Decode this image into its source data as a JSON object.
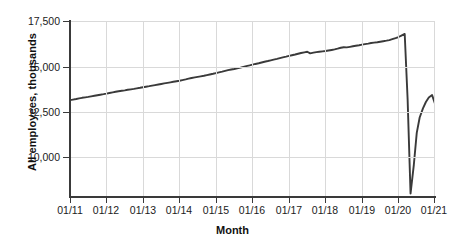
{
  "chart_data": {
    "type": "line",
    "title": "",
    "xlabel": "Month",
    "ylabel": "All employees, thousands",
    "grid": true,
    "legend": "none",
    "xlim": [
      2011.0,
      2021.0
    ],
    "ylim": [
      7830,
      17500
    ],
    "ytick_labels": [
      "17,500",
      "15,000",
      "12,500",
      "10,000"
    ],
    "ytick_values": [
      17500,
      15000,
      12500,
      10000
    ],
    "xtick_labels": [
      "01/11",
      "01/12",
      "01/13",
      "01/14",
      "01/15",
      "01/16",
      "01/17",
      "01/18",
      "01/19",
      "01/20",
      "01/21"
    ],
    "xtick_values": [
      2011,
      2012,
      2013,
      2014,
      2015,
      2016,
      2017,
      2018,
      2019,
      2020,
      2021
    ],
    "series": [
      {
        "name": "All employees",
        "color": "#3a3a3a",
        "x": [
          2011.0,
          2011.08,
          2011.17,
          2011.25,
          2011.33,
          2011.42,
          2011.5,
          2011.58,
          2011.67,
          2011.75,
          2011.83,
          2011.92,
          2012.0,
          2012.08,
          2012.17,
          2012.25,
          2012.33,
          2012.42,
          2012.5,
          2012.58,
          2012.67,
          2012.75,
          2012.83,
          2012.92,
          2013.0,
          2013.08,
          2013.17,
          2013.25,
          2013.33,
          2013.42,
          2013.5,
          2013.58,
          2013.67,
          2013.75,
          2013.83,
          2013.92,
          2014.0,
          2014.08,
          2014.17,
          2014.25,
          2014.33,
          2014.42,
          2014.5,
          2014.58,
          2014.67,
          2014.75,
          2014.83,
          2014.92,
          2015.0,
          2015.08,
          2015.17,
          2015.25,
          2015.33,
          2015.42,
          2015.5,
          2015.58,
          2015.67,
          2015.75,
          2015.83,
          2015.92,
          2016.0,
          2016.08,
          2016.17,
          2016.25,
          2016.33,
          2016.42,
          2016.5,
          2016.58,
          2016.67,
          2016.75,
          2016.83,
          2016.92,
          2017.0,
          2017.08,
          2017.17,
          2017.25,
          2017.33,
          2017.42,
          2017.5,
          2017.58,
          2017.67,
          2017.75,
          2017.83,
          2017.92,
          2018.0,
          2018.08,
          2018.17,
          2018.25,
          2018.33,
          2018.42,
          2018.5,
          2018.58,
          2018.67,
          2018.75,
          2018.83,
          2018.92,
          2019.0,
          2019.08,
          2019.17,
          2019.25,
          2019.33,
          2019.42,
          2019.5,
          2019.58,
          2019.67,
          2019.75,
          2019.83,
          2019.92,
          2020.0,
          2020.08,
          2020.17,
          2020.25,
          2020.33,
          2020.42,
          2020.5,
          2020.58,
          2020.67,
          2020.75,
          2020.83,
          2020.92,
          2021.0
        ],
        "values": [
          13150,
          13180,
          13215,
          13250,
          13280,
          13305,
          13330,
          13360,
          13390,
          13420,
          13450,
          13480,
          13510,
          13545,
          13580,
          13610,
          13640,
          13665,
          13690,
          13720,
          13745,
          13770,
          13800,
          13830,
          13860,
          13890,
          13920,
          13950,
          13980,
          14010,
          14040,
          14070,
          14100,
          14130,
          14160,
          14190,
          14220,
          14255,
          14290,
          14330,
          14370,
          14400,
          14430,
          14460,
          14490,
          14525,
          14560,
          14600,
          14640,
          14680,
          14720,
          14760,
          14800,
          14835,
          14865,
          14900,
          14940,
          14980,
          15020,
          15060,
          15100,
          15140,
          15180,
          15220,
          15260,
          15300,
          15340,
          15380,
          15420,
          15460,
          15500,
          15540,
          15580,
          15620,
          15660,
          15700,
          15740,
          15780,
          15810,
          15720,
          15760,
          15790,
          15810,
          15830,
          15850,
          15880,
          15910,
          15940,
          15980,
          16030,
          16060,
          16050,
          16080,
          16110,
          16140,
          16170,
          16200,
          16230,
          16260,
          16290,
          16310,
          16330,
          16360,
          16390,
          16420,
          16450,
          16500,
          16560,
          16620,
          16700,
          16790,
          13180,
          8020,
          9600,
          11350,
          12200,
          12700,
          13050,
          13300,
          13430,
          12950
        ]
      }
    ],
    "annotations": [
      {
        "label": "pre-pandemic peak",
        "value": 16790
      },
      {
        "label": "pandemic trough",
        "value": 8020
      },
      {
        "label": "series start",
        "value": 13150
      },
      {
        "label": "series end",
        "value": 12950
      }
    ]
  }
}
